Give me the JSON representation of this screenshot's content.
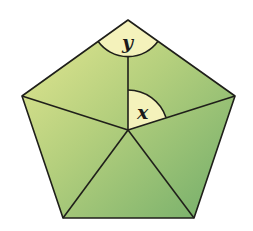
{
  "figure": {
    "shape": "regular pentagon divided into 5 triangles from an interior point",
    "vertices": {
      "top": [
        128,
        20
      ],
      "right": [
        235,
        96
      ],
      "bottom_right": [
        194,
        218
      ],
      "bottom_left": [
        63,
        218
      ],
      "left": [
        22,
        96
      ]
    },
    "interior_point": [
      128,
      130
    ],
    "angles": [
      {
        "label": "y",
        "vertex": "top",
        "description": "interior angle of pentagon at top vertex"
      },
      {
        "label": "x",
        "vertex": "interior_point",
        "description": "angle between segment to top vertex and segment to right vertex"
      }
    ],
    "colors": {
      "fill_light": "#dfe38f",
      "fill_dark": "#7db46d",
      "angle_sector": "#f4f2bb",
      "stroke": "#1f1f1a"
    }
  },
  "labels": {
    "y": "y",
    "x": "x"
  }
}
